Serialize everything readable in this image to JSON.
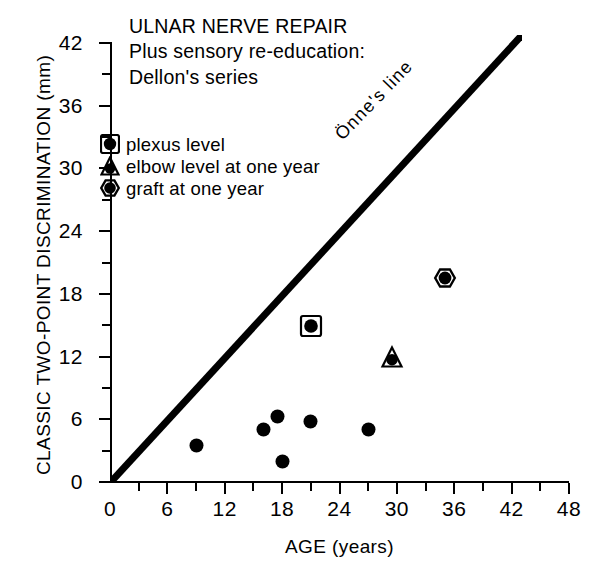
{
  "chart_data": {
    "type": "scatter",
    "title": "ULNAR NERVE REPAIR",
    "subtitle_1": "Plus sensory re-education:",
    "subtitle_2": "Dellon's series",
    "xlabel": "AGE (years)",
    "ylabel": "CLASSIC TWO-POINT DISCRIMINATION (mm)",
    "xlim": [
      0,
      48
    ],
    "ylim": [
      0,
      42
    ],
    "x_ticks": [
      0,
      6,
      12,
      18,
      24,
      30,
      36,
      42,
      48
    ],
    "y_ticks": [
      0,
      6,
      12,
      18,
      24,
      30,
      36,
      42
    ],
    "x_minor_step": 3,
    "y_minor_step": 3,
    "grid": false,
    "legend_position": "upper-left-inside",
    "annotations": [
      {
        "text": "Önne's line",
        "x": 17,
        "y": 27,
        "rotation": -46
      }
    ],
    "reference_line": {
      "name": "Önne's line",
      "x_start": 0,
      "y_start": 0,
      "x_end": 43,
      "y_end": 43,
      "color": "#000000",
      "width_px": 7
    },
    "series": [
      {
        "name": "unlabeled",
        "marker": "filled-circle",
        "color": "#000000",
        "points": [
          {
            "x": 9,
            "y": 3.5
          },
          {
            "x": 16,
            "y": 5.0
          },
          {
            "x": 17.5,
            "y": 6.3
          },
          {
            "x": 18,
            "y": 2.0
          },
          {
            "x": 21,
            "y": 5.8
          },
          {
            "x": 27,
            "y": 5.0
          }
        ]
      },
      {
        "name": "plexus level",
        "marker": "square-circle",
        "color": "#000000",
        "points": [
          {
            "x": 21,
            "y": 14.9
          }
        ]
      },
      {
        "name": "elbow level at one year",
        "marker": "triangle-circle",
        "color": "#000000",
        "points": [
          {
            "x": 29.5,
            "y": 12.0
          }
        ]
      },
      {
        "name": "graft at one year",
        "marker": "hexagon-circle",
        "color": "#000000",
        "points": [
          {
            "x": 35,
            "y": 19.5
          }
        ]
      }
    ]
  },
  "legend": {
    "items": [
      {
        "marker": "square-circle",
        "label": "plexus level"
      },
      {
        "marker": "triangle-circle",
        "label": "elbow level at one year"
      },
      {
        "marker": "hexagon-circle",
        "label": "graft at one year"
      }
    ]
  }
}
